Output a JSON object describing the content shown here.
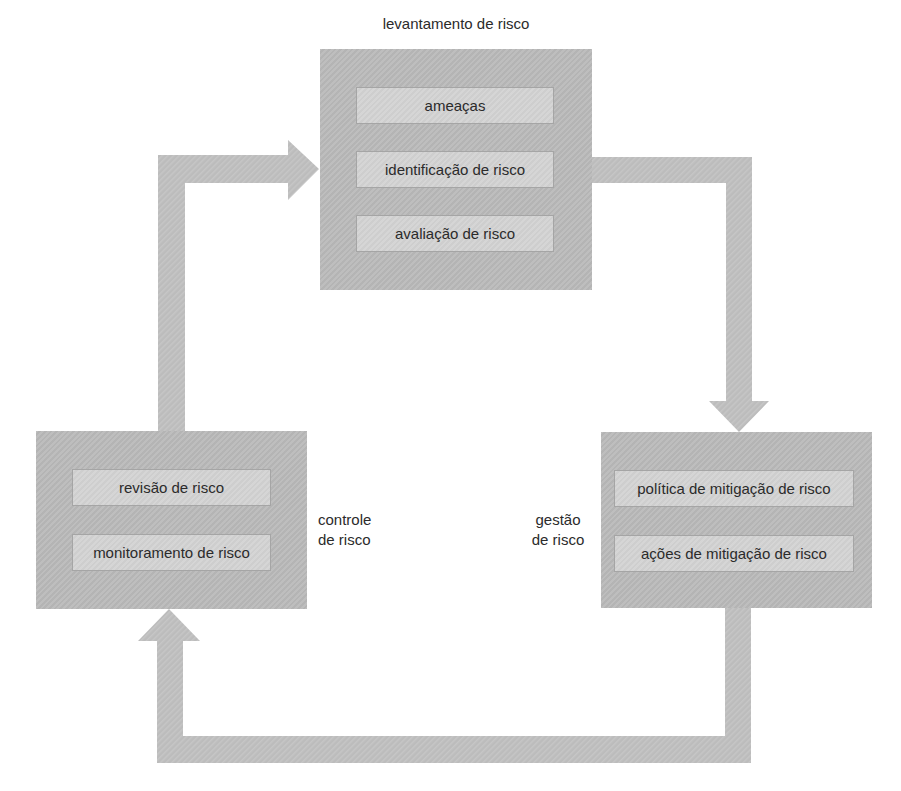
{
  "diagram": {
    "title": "levantamento de risco",
    "colors": {
      "block_fill": "#bababa",
      "inner_fill": "#d2d2d2",
      "inner_border": "#a5a5a5",
      "arrow_fill": "#bcbcbc",
      "text": "#2b2b2b",
      "background": "#ffffff"
    },
    "blocks": {
      "assessment": {
        "label": "levantamento de risco",
        "items": [
          "ameaças",
          "identificação de risco",
          "avaliação de risco"
        ]
      },
      "control": {
        "label_line1": "controle",
        "label_line2": "de risco",
        "items": [
          "revisão de risco",
          "monitoramento de risco"
        ]
      },
      "management": {
        "label_line1": "gestão",
        "label_line2": "de risco",
        "items": [
          "política de mitigação de risco",
          "ações de mitigação de risco"
        ]
      }
    },
    "flow": [
      {
        "from": "controle de risco",
        "to": "levantamento de risco"
      },
      {
        "from": "levantamento de risco",
        "to": "gestão de risco"
      },
      {
        "from": "gestão de risco",
        "to": "controle de risco"
      }
    ]
  }
}
